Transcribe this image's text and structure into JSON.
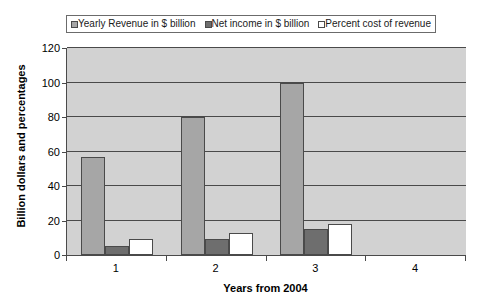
{
  "chart_data": {
    "type": "bar",
    "title": "",
    "xlabel": "Years from 2004",
    "ylabel": "Billion dollars and percentages",
    "categories": [
      "1",
      "2",
      "3",
      "4"
    ],
    "ylim": [
      0,
      120
    ],
    "yticks": [
      0,
      20,
      40,
      60,
      80,
      100,
      120
    ],
    "grid": true,
    "legend_position": "top",
    "series": [
      {
        "name": "Yearly Revenue in $ billion",
        "color": "#a6a6a6",
        "values": [
          57,
          80,
          100,
          null
        ]
      },
      {
        "name": "Net income in $ billion",
        "color": "#6e6e6e",
        "values": [
          5,
          9,
          15,
          null
        ]
      },
      {
        "name": "Percent cost of revenue",
        "color": "#ffffff",
        "values": [
          9,
          13,
          18,
          null
        ]
      }
    ]
  },
  "axis": {
    "y_title": "Billion dollars and percentages",
    "x_title": "Years from 2004",
    "y_tick_labels": [
      "120",
      "100",
      "80",
      "60",
      "40",
      "20",
      "0"
    ],
    "x_tick_labels": [
      "1",
      "2",
      "3",
      "4"
    ]
  },
  "legend": {
    "items": [
      {
        "label": "Yearly Revenue in $ billion",
        "swatch": "legend-swatch-revenue"
      },
      {
        "label": "Net income in $ billion",
        "swatch": "legend-swatch-netincome"
      },
      {
        "label": "Percent cost of revenue",
        "swatch": "legend-swatch-pctcost"
      }
    ]
  },
  "title": {
    "text": ""
  }
}
